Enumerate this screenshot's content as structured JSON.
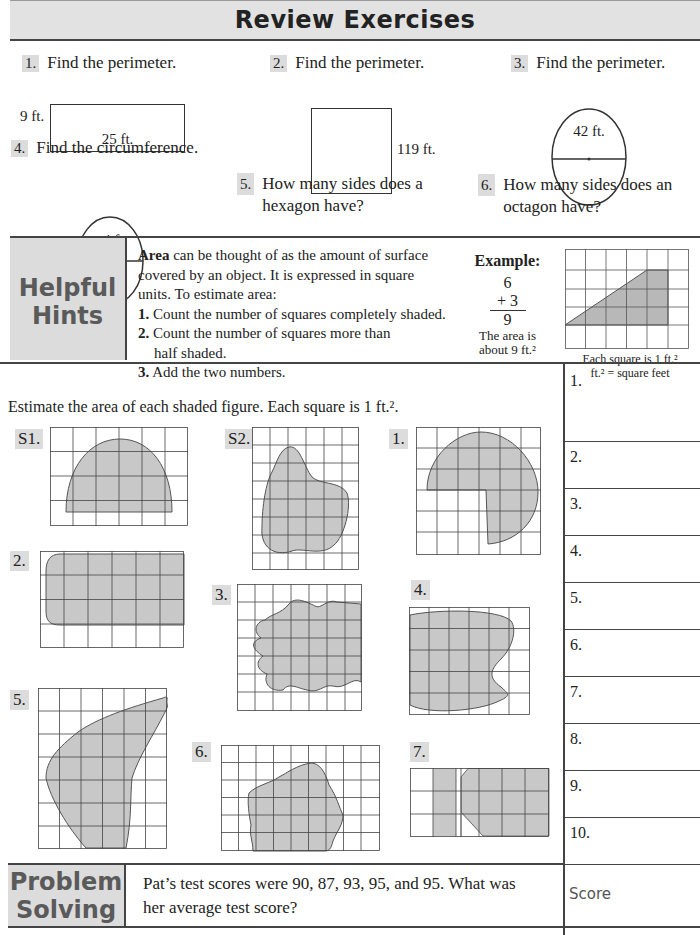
{
  "header": {
    "title": "Review Exercises"
  },
  "review": {
    "items": [
      {
        "num": "1.",
        "text": "Find the perimeter.",
        "labels": {
          "side": "9 ft.",
          "bottom": "25 ft."
        }
      },
      {
        "num": "2.",
        "text": "Find the perimeter.",
        "labels": {
          "side": "119 ft."
        }
      },
      {
        "num": "3.",
        "text": "Find the perimeter.",
        "labels": {
          "diameter": "42 ft."
        }
      },
      {
        "num": "4.",
        "text": "Find the circumference.",
        "labels": {
          "radius": "4 ft."
        }
      },
      {
        "num": "5.",
        "text_line1": "How many sides does a",
        "text_line2": "hexagon have?"
      },
      {
        "num": "6.",
        "text_line1": "How many sides does an",
        "text_line2": "octagon have?"
      }
    ]
  },
  "hints": {
    "label_line1": "Helpful",
    "label_line2": "Hints",
    "area_bold": "Area",
    "intro_line1": " can be thought of as the amount of surface",
    "intro_line2": "covered by an object.  It is expressed in square",
    "intro_line3": "units.  To estimate area:",
    "steps": [
      {
        "num": "1.",
        "text": " Count the number of squares completely shaded."
      },
      {
        "num": "2.",
        "text": " Count the number of squares more than",
        "text2": "half shaded."
      },
      {
        "num": "3.",
        "text": " Add the two numbers."
      }
    ],
    "example": {
      "title": "Example:",
      "a": "6",
      "b": "+ 3",
      "sum": "9",
      "note_line1": "The area is",
      "note_line2": "about 9 ft.²",
      "caption_line1": "Each square is 1 ft.²",
      "caption_line2": "ft.² = square feet"
    }
  },
  "estimate": {
    "instruction": "Estimate the area of each shaded figure.  Each square is 1 ft.².",
    "figures": [
      {
        "label": "S1."
      },
      {
        "label": "S2."
      },
      {
        "label": "1."
      },
      {
        "label": "2."
      },
      {
        "label": "3."
      },
      {
        "label": "4."
      },
      {
        "label": "5."
      },
      {
        "label": "6."
      },
      {
        "label": "7."
      }
    ]
  },
  "answers": {
    "rows": [
      "1.",
      "2.",
      "3.",
      "4.",
      "5.",
      "6.",
      "7.",
      "8.",
      "9.",
      "10."
    ],
    "score_label": "Score"
  },
  "problem_solving": {
    "label_line1": "Problem",
    "label_line2": "Solving",
    "text_line1": "Pat’s test scores were 90, 87, 93, 95, and 95. What was",
    "text_line2": "her average test score?"
  }
}
